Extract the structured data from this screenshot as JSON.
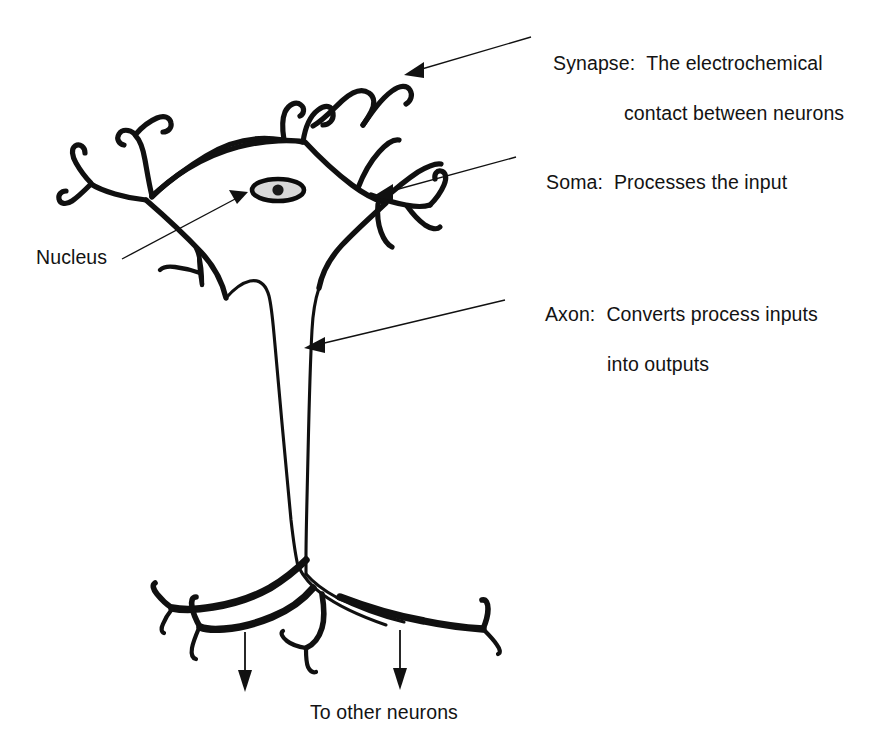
{
  "figure": {
    "background_color": "#ffffff",
    "ink_color": "#101010",
    "nucleus_fill": "#d8d8d8"
  },
  "labels": {
    "synapse": {
      "term": "Synapse:",
      "description_line1": "The electrochemical",
      "description_line2": "contact between neurons"
    },
    "soma": {
      "term": "Soma:",
      "description_line1": "Processes the input"
    },
    "axon": {
      "term": "Axon:",
      "description_line1": "Converts process inputs",
      "description_line2": "into outputs"
    },
    "nucleus": {
      "term": "Nucleus"
    },
    "output_caption": {
      "text": "To other neurons"
    }
  },
  "parts": [
    {
      "name": "synapse",
      "label": "Synapse"
    },
    {
      "name": "soma",
      "label": "Soma"
    },
    {
      "name": "axon",
      "label": "Axon"
    },
    {
      "name": "nucleus",
      "label": "Nucleus"
    },
    {
      "name": "dendrites",
      "label": "Dendrites"
    },
    {
      "name": "axon-terminals",
      "label": "Axon terminals"
    }
  ],
  "annotations": {
    "leader_lines": [
      {
        "name": "synapse-leader",
        "from": [
          531,
          37
        ],
        "to": [
          407,
          74
        ]
      },
      {
        "name": "soma-leader",
        "from": [
          516,
          157
        ],
        "to": [
          375,
          196
        ]
      },
      {
        "name": "axon-leader",
        "from": [
          505,
          300
        ],
        "to": [
          306,
          348
        ]
      },
      {
        "name": "nucleus-leader",
        "from": [
          122,
          259
        ],
        "to": [
          246,
          194
        ]
      }
    ],
    "flow_arrows": [
      {
        "name": "left-output-arrow",
        "from": [
          245,
          632
        ],
        "to": [
          245,
          690
        ]
      },
      {
        "name": "right-output-arrow",
        "from": [
          400,
          630
        ],
        "to": [
          400,
          688
        ]
      }
    ]
  }
}
